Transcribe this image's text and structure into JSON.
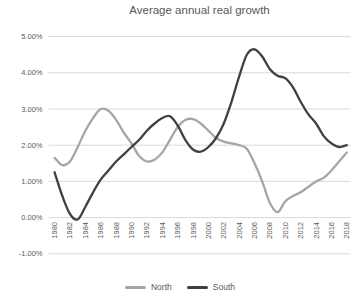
{
  "chart_data": {
    "type": "line",
    "title": "Average annual real growth",
    "x": [
      1980,
      1981,
      1982,
      1983,
      1984,
      1985,
      1986,
      1987,
      1988,
      1989,
      1990,
      1991,
      1992,
      1993,
      1994,
      1995,
      1996,
      1997,
      1998,
      1999,
      2000,
      2001,
      2002,
      2003,
      2004,
      2005,
      2006,
      2007,
      2008,
      2009,
      2010,
      2011,
      2012,
      2013,
      2014,
      2015,
      2016,
      2017,
      2018
    ],
    "x_tick_labels": [
      "1980",
      "1982",
      "1984",
      "1986",
      "1988",
      "1990",
      "1992",
      "1994",
      "1996",
      "1998",
      "2000",
      "2002",
      "2004",
      "2006",
      "2008",
      "2010",
      "2012",
      "2014",
      "2016",
      "2018"
    ],
    "y_ticks": [
      "5.00%",
      "4.00%",
      "3.00%",
      "2.00%",
      "1.00%",
      "0.00%",
      "-1.00%"
    ],
    "y_tick_values": [
      5,
      4,
      3,
      2,
      1,
      0,
      -1
    ],
    "ylim": [
      -1,
      5
    ],
    "value_format": "percent",
    "grid": true,
    "legend_position": "bottom",
    "series": [
      {
        "name": "North",
        "color": "#a6a6a6",
        "values": [
          1.65,
          1.45,
          1.55,
          1.95,
          2.4,
          2.75,
          3.0,
          2.95,
          2.7,
          2.35,
          2.05,
          1.7,
          1.55,
          1.6,
          1.8,
          2.15,
          2.5,
          2.7,
          2.72,
          2.6,
          2.4,
          2.2,
          2.1,
          2.05,
          2.0,
          1.9,
          1.5,
          1.0,
          0.4,
          0.15,
          0.45,
          0.6,
          0.7,
          0.85,
          1.0,
          1.1,
          1.3,
          1.55,
          1.8
        ]
      },
      {
        "name": "South",
        "color": "#404040",
        "values": [
          1.25,
          0.6,
          0.1,
          -0.05,
          0.3,
          0.7,
          1.05,
          1.3,
          1.55,
          1.75,
          1.95,
          2.15,
          2.4,
          2.6,
          2.75,
          2.8,
          2.55,
          2.15,
          1.88,
          1.82,
          1.95,
          2.2,
          2.6,
          3.2,
          3.9,
          4.5,
          4.65,
          4.45,
          4.1,
          3.92,
          3.85,
          3.6,
          3.2,
          2.85,
          2.6,
          2.25,
          2.05,
          1.95,
          2.0
        ]
      }
    ],
    "colors": {
      "gridline": "#d9d9d9",
      "axis_text": "#595959",
      "title_text": "#595959",
      "background": "#ffffff"
    }
  }
}
